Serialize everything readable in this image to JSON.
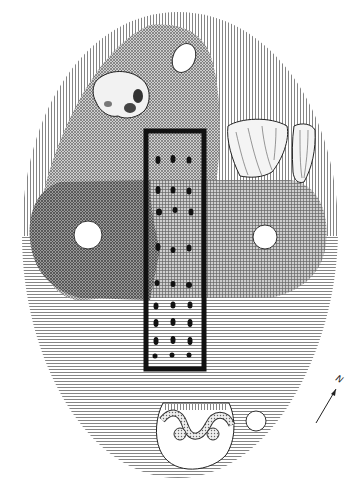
{
  "diagram": {
    "type": "archaeological-site-plan",
    "north_label": "N",
    "zones": [
      {
        "name": "outer-mound",
        "pattern": "vertical-lines-top / horizontal-lines-bottom"
      },
      {
        "name": "upper-diagonal-zone",
        "pattern": "diagonal-crosshatch"
      },
      {
        "name": "left-dark-band",
        "pattern": "dense-crosshatch"
      },
      {
        "name": "right-grid-band",
        "pattern": "square-grid"
      }
    ],
    "grave": {
      "shape": "rectangle",
      "dot_rows": 10,
      "dots_per_row": 3
    },
    "finds": [
      {
        "name": "flint-nodule"
      },
      {
        "name": "flint-blade-large"
      },
      {
        "name": "flint-blade-small"
      },
      {
        "name": "decorated-pot"
      }
    ],
    "postholes": 4,
    "colors": {
      "ink": "#1a1a1a",
      "paper": "#ffffff",
      "hatch": "#555555"
    }
  }
}
